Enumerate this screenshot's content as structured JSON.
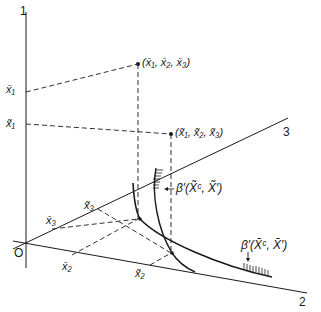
{
  "figure": {
    "axes": {
      "axis_1_label": "1",
      "axis_2_label": "2",
      "axis_3_label": "3",
      "origin_label": "O"
    },
    "points": {
      "bar_point_label": "(x̄₁, x̄₂, x̄₃)",
      "tilde_point_label": "(x̃₁, x̃₂, x̃₃)"
    },
    "ticks": {
      "x1_bar": "x̄₁",
      "x1_tilde": "x̃₁",
      "x2_bar": "x̄₂",
      "x2_tilde": "x̃₂",
      "x3_bar": "x̄₃",
      "x3_tilde": "x̃₃"
    },
    "curves": {
      "tilde_curve_label": "β′(X̃ᶜ, X̃′)",
      "bar_curve_label": "β′(X̄ᶜ, X̄′)"
    },
    "colors": {
      "ink": "#1a1a1a",
      "background": "#ffffff"
    }
  }
}
